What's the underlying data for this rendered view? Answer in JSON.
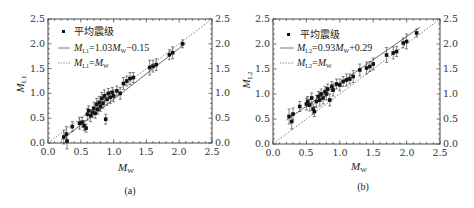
{
  "chart_data": [
    {
      "type": "scatter",
      "panel": "(a)",
      "xlabel": "M_W",
      "ylabel": "M_L1",
      "xlim": [
        0.0,
        2.5
      ],
      "ylim": [
        0.0,
        2.5
      ],
      "xticks": [
        "0.0",
        "0.5",
        "1.0",
        "1.5",
        "2.0",
        "2.5"
      ],
      "yticks": [
        "0.0",
        "0.5",
        "1.0",
        "1.5",
        "2.0",
        "2.5"
      ],
      "grid": false,
      "legend_position": "upper left",
      "legend": [
        {
          "marker": "square",
          "label": "平均震级"
        },
        {
          "line": "solid",
          "label": "M_L1=1.03M_W−0.15"
        },
        {
          "line": "dotted",
          "label": "M_L1=M_W"
        }
      ],
      "fit": {
        "slope": 1.03,
        "intercept": -0.15
      },
      "points": [
        [
          0.24,
          0.12,
          0.14
        ],
        [
          0.28,
          0.18,
          0.15
        ],
        [
          0.29,
          0.04,
          0.16
        ],
        [
          0.37,
          0.33,
          0.1
        ],
        [
          0.48,
          0.4,
          0.12
        ],
        [
          0.52,
          0.42,
          0.1
        ],
        [
          0.55,
          0.35,
          0.1
        ],
        [
          0.58,
          0.3,
          0.08
        ],
        [
          0.6,
          0.58,
          0.12
        ],
        [
          0.62,
          0.65,
          0.1
        ],
        [
          0.65,
          0.55,
          0.12
        ],
        [
          0.68,
          0.62,
          0.1
        ],
        [
          0.7,
          0.7,
          0.12
        ],
        [
          0.72,
          0.6,
          0.1
        ],
        [
          0.74,
          0.78,
          0.12
        ],
        [
          0.76,
          0.68,
          0.1
        ],
        [
          0.78,
          0.82,
          0.12
        ],
        [
          0.8,
          0.74,
          0.1
        ],
        [
          0.82,
          0.9,
          0.12
        ],
        [
          0.84,
          0.8,
          0.1
        ],
        [
          0.86,
          0.95,
          0.12
        ],
        [
          0.88,
          0.48,
          0.1
        ],
        [
          0.9,
          0.88,
          0.12
        ],
        [
          0.92,
          1.0,
          0.1
        ],
        [
          0.95,
          0.92,
          0.12
        ],
        [
          0.98,
          1.02,
          0.1
        ],
        [
          1.0,
          0.95,
          0.12
        ],
        [
          1.05,
          1.05,
          0.1
        ],
        [
          1.1,
          1.0,
          0.12
        ],
        [
          1.15,
          1.2,
          0.12
        ],
        [
          1.2,
          1.25,
          0.1
        ],
        [
          1.25,
          1.3,
          0.12
        ],
        [
          1.3,
          1.32,
          0.1
        ],
        [
          1.55,
          1.52,
          0.15
        ],
        [
          1.6,
          1.55,
          0.12
        ],
        [
          1.65,
          1.58,
          0.12
        ],
        [
          1.85,
          1.78,
          0.1
        ],
        [
          1.9,
          1.82,
          0.12
        ],
        [
          2.05,
          2.0,
          0.08
        ]
      ]
    },
    {
      "type": "scatter",
      "panel": "(b)",
      "xlabel": "M_W",
      "ylabel": "M_L2",
      "xlim": [
        0.0,
        2.5
      ],
      "ylim": [
        0.0,
        2.5
      ],
      "xticks": [
        "0.0",
        "0.5",
        "1.0",
        "1.5",
        "2.0",
        "2.5"
      ],
      "yticks": [
        "0.0",
        "0.5",
        "1.0",
        "1.5",
        "2.0",
        "2.5"
      ],
      "grid": false,
      "legend_position": "upper left",
      "legend": [
        {
          "marker": "square",
          "label": "平均震级"
        },
        {
          "line": "solid",
          "label": "M_L2=0.93M_W+0.29"
        },
        {
          "line": "dotted",
          "label": "M_L2=M_W"
        }
      ],
      "fit": {
        "slope": 0.93,
        "intercept": 0.29
      },
      "points": [
        [
          0.24,
          0.55,
          0.15
        ],
        [
          0.28,
          0.45,
          0.15
        ],
        [
          0.3,
          0.6,
          0.12
        ],
        [
          0.4,
          0.75,
          0.1
        ],
        [
          0.5,
          0.8,
          0.12
        ],
        [
          0.52,
          0.85,
          0.1
        ],
        [
          0.55,
          0.78,
          0.12
        ],
        [
          0.58,
          0.92,
          0.1
        ],
        [
          0.6,
          0.7,
          0.1
        ],
        [
          0.62,
          0.65,
          0.1
        ],
        [
          0.65,
          0.85,
          0.12
        ],
        [
          0.68,
          0.95,
          0.1
        ],
        [
          0.7,
          0.88,
          0.12
        ],
        [
          0.72,
          1.0,
          0.1
        ],
        [
          0.75,
          0.92,
          0.12
        ],
        [
          0.78,
          1.05,
          0.1
        ],
        [
          0.8,
          1.0,
          0.12
        ],
        [
          0.82,
          1.1,
          0.1
        ],
        [
          0.85,
          0.88,
          0.12
        ],
        [
          0.88,
          1.15,
          0.1
        ],
        [
          0.9,
          1.08,
          0.12
        ],
        [
          0.95,
          1.2,
          0.1
        ],
        [
          1.0,
          1.18,
          0.12
        ],
        [
          1.05,
          1.25,
          0.1
        ],
        [
          1.1,
          1.28,
          0.12
        ],
        [
          1.15,
          1.3,
          0.1
        ],
        [
          1.2,
          1.35,
          0.12
        ],
        [
          1.3,
          1.48,
          0.12
        ],
        [
          1.4,
          1.52,
          0.12
        ],
        [
          1.45,
          1.55,
          0.1
        ],
        [
          1.5,
          1.6,
          0.12
        ],
        [
          1.7,
          1.78,
          0.15
        ],
        [
          1.8,
          1.82,
          0.12
        ],
        [
          1.85,
          1.85,
          0.1
        ],
        [
          1.95,
          2.02,
          0.1
        ],
        [
          2.0,
          2.05,
          0.15
        ],
        [
          2.15,
          2.22,
          0.08
        ]
      ]
    }
  ],
  "panels": {
    "a": {
      "caption": "(a)",
      "xlabel_main": "M",
      "xlabel_sub": "W",
      "ylabel_main": "M",
      "ylabel_sub": "L1",
      "legend": {
        "marker_label": "平均震级",
        "fit_main": "M",
        "fit_sub": "L1",
        "fit_eq": "=1.03",
        "fit_m": "M",
        "fit_msub": "W",
        "fit_tail": "−0.15",
        "id_main": "M",
        "id_sub": "L1",
        "id_eq": "=",
        "id_m": "M",
        "id_msub": "W"
      }
    },
    "b": {
      "caption": "(b)",
      "xlabel_main": "M",
      "xlabel_sub": "W",
      "ylabel_main": "M",
      "ylabel_sub": "L2",
      "legend": {
        "marker_label": "平均震级",
        "fit_main": "M",
        "fit_sub": "L2",
        "fit_eq": "=0.93",
        "fit_m": "M",
        "fit_msub": "W",
        "fit_tail": "+0.29",
        "id_main": "M",
        "id_sub": "L2",
        "id_eq": "=",
        "id_m": "M",
        "id_msub": "W"
      }
    },
    "ticks": [
      "0.0",
      "0.5",
      "1.0",
      "1.5",
      "2.0",
      "2.5"
    ]
  }
}
